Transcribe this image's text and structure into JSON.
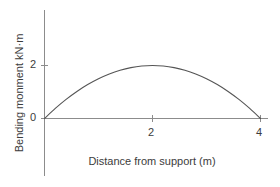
{
  "chart_data": {
    "type": "line",
    "title": "",
    "subtitle": "",
    "xlabel": "Distance from support (m)",
    "ylabel": "Bending monment  kN·m",
    "xlim": [
      0,
      4
    ],
    "ylim": [
      0,
      3
    ],
    "xticks": [
      2,
      4
    ],
    "yticks": [
      0,
      2
    ],
    "xtick_labels": [
      "2",
      "4"
    ],
    "ytick_labels": [
      "0",
      "2"
    ],
    "grid": false,
    "legend": null,
    "annotations": [],
    "series": [
      {
        "name": "Bending moment",
        "curve": "parabola",
        "equation": "M = x(4 - x) / 2",
        "peak": {
          "x": 2,
          "y": 2
        },
        "x": [
          0,
          0.2,
          0.4,
          0.6,
          0.8,
          1.0,
          1.2,
          1.4,
          1.6,
          1.8,
          2.0,
          2.2,
          2.4,
          2.6,
          2.8,
          3.0,
          3.2,
          3.4,
          3.6,
          3.8,
          4.0
        ],
        "values": [
          0,
          0.38,
          0.72,
          1.02,
          1.28,
          1.5,
          1.68,
          1.82,
          1.92,
          1.98,
          2.0,
          1.98,
          1.92,
          1.82,
          1.68,
          1.5,
          1.28,
          1.02,
          0.72,
          0.38,
          0
        ]
      }
    ],
    "colors": {
      "background": "#ffffff",
      "axis": "#8c8c8c",
      "curve": "#555555",
      "text": "#3c3c3c"
    }
  },
  "axis_labels": {
    "y_axis": "Bending monment  kN·m",
    "x_axis": "Distance from support (m)"
  },
  "ticks": {
    "y_2": "2",
    "y_0": "0",
    "x_2": "2",
    "x_4": "4"
  }
}
